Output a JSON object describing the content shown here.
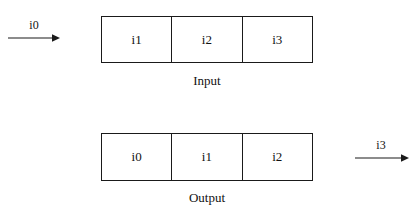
{
  "diagram": {
    "background_color": "#ffffff",
    "line_color": "#1a1a1a",
    "text_color": "#121212",
    "input_arrow": {
      "label": "i0",
      "direction": "right",
      "icon": "arrow-right-icon"
    },
    "input_buffer": {
      "caption": "Input",
      "cells": [
        {
          "label": "i1"
        },
        {
          "label": "i2"
        },
        {
          "label": "i3"
        }
      ]
    },
    "output_buffer": {
      "caption": "Output",
      "cells": [
        {
          "label": "i0"
        },
        {
          "label": "i1"
        },
        {
          "label": "i2"
        }
      ]
    },
    "output_arrow": {
      "label": "i3",
      "direction": "right",
      "icon": "arrow-right-icon"
    }
  }
}
